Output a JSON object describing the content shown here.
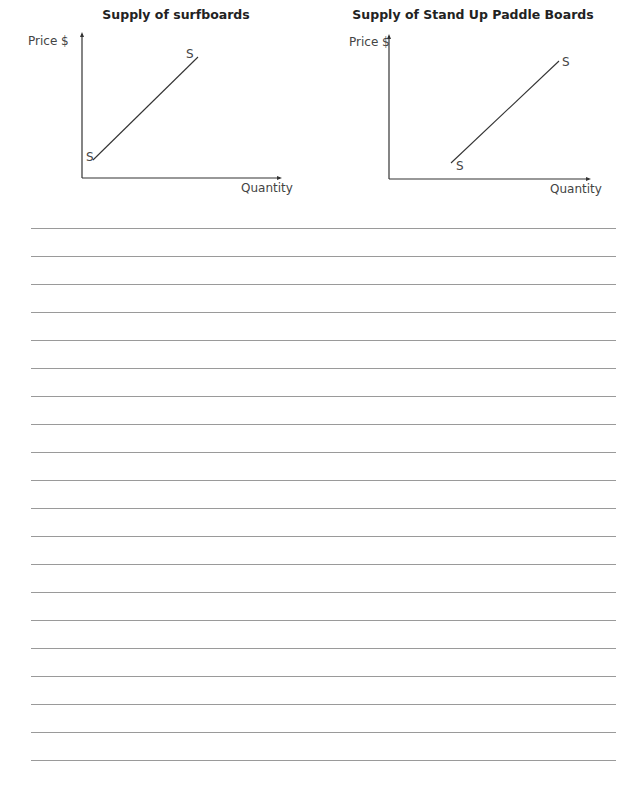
{
  "graphs": [
    {
      "title": "Supply of surfboards",
      "y_axis_label": "Price $",
      "x_axis_label": "Quantity",
      "curve_label_start": "S",
      "curve_label_end": "S"
    },
    {
      "title": "Supply of Stand Up Paddle Boards",
      "y_axis_label": "Price $",
      "x_axis_label": "Quantity",
      "curve_label_start": "S",
      "curve_label_end": "S"
    }
  ],
  "answer_lines": {
    "count": 20,
    "spacing_px": 28
  }
}
